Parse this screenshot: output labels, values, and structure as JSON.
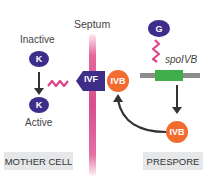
{
  "diagram": {
    "septum_label": "Septum",
    "mother_cell": {
      "inactive_label": "Inactive",
      "active_label": "Active",
      "protein_k": "K",
      "box_label": "MOTHER CELL"
    },
    "membrane": {
      "ivf_label": "IVF",
      "ivb_label": "IVB"
    },
    "prespore": {
      "protein_g": "G",
      "gene_label": "spoIVB",
      "ivb_label": "IVB",
      "box_label": "PRESPORE"
    },
    "colors": {
      "purple": "#3f2d8a",
      "orange": "#f26b2f",
      "pink": "#d94f8b",
      "green": "#3fae4a",
      "gray_gene": "#8c8c8c",
      "box_bg": "#e6e7e8",
      "arrow": "#333333"
    }
  }
}
